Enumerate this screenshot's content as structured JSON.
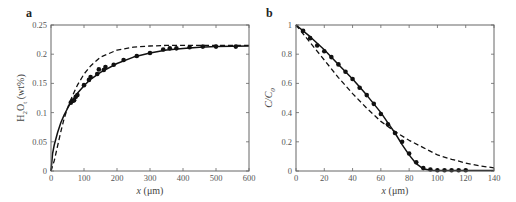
{
  "chart_data": [
    {
      "panel": "a",
      "type": "line",
      "title": "",
      "xlabel": "x (μm)",
      "ylabel": "H2Ot (wt%)",
      "xlim": [
        0,
        600
      ],
      "ylim": [
        0,
        0.25
      ],
      "xticks": [
        0,
        100,
        200,
        300,
        400,
        500,
        600
      ],
      "yticks": [
        0,
        0.05,
        0.1,
        0.15,
        0.2,
        0.25
      ],
      "xtick_labels": [
        "0",
        "100",
        "200",
        "300",
        "400",
        "500",
        "600"
      ],
      "ytick_labels": [
        "0",
        "0.05",
        "0.1",
        "0.15",
        "0.2",
        "0.25"
      ],
      "grid": false,
      "legend": null,
      "series": [
        {
          "name": "measured",
          "style": "points",
          "x": [
            60,
            65,
            70,
            75,
            80,
            100,
            115,
            120,
            140,
            145,
            160,
            165,
            190,
            220,
            260,
            300,
            340,
            360,
            380,
            420,
            460,
            500,
            560
          ],
          "y": [
            0.117,
            0.12,
            0.121,
            0.127,
            0.13,
            0.147,
            0.156,
            0.161,
            0.166,
            0.174,
            0.173,
            0.178,
            0.182,
            0.19,
            0.197,
            0.202,
            0.208,
            0.21,
            0.21,
            0.212,
            0.213,
            0.213,
            0.213
          ]
        },
        {
          "name": "fit (solid)",
          "style": "solid",
          "x": [
            0,
            5,
            10,
            20,
            30,
            40,
            50,
            60,
            80,
            100,
            120,
            150,
            200,
            250,
            300,
            350,
            400,
            450,
            500,
            600
          ],
          "y": [
            0,
            0.03,
            0.045,
            0.066,
            0.083,
            0.096,
            0.107,
            0.117,
            0.133,
            0.146,
            0.157,
            0.169,
            0.184,
            0.195,
            0.202,
            0.207,
            0.21,
            0.212,
            0.213,
            0.214
          ]
        },
        {
          "name": "model (dashed)",
          "style": "dashed",
          "x": [
            0,
            10,
            20,
            30,
            40,
            50,
            60,
            70,
            80,
            100,
            120,
            150,
            200,
            250,
            300,
            350,
            400,
            500,
            600
          ],
          "y": [
            0,
            0.018,
            0.043,
            0.068,
            0.09,
            0.108,
            0.122,
            0.135,
            0.147,
            0.166,
            0.18,
            0.195,
            0.207,
            0.212,
            0.214,
            0.215,
            0.215,
            0.215,
            0.215
          ]
        }
      ]
    },
    {
      "panel": "b",
      "type": "line",
      "title": "",
      "xlabel": "x (μm)",
      "ylabel": "C/C0",
      "xlim": [
        0,
        140
      ],
      "ylim": [
        0,
        1
      ],
      "xticks": [
        0,
        20,
        40,
        60,
        80,
        100,
        120,
        140
      ],
      "yticks": [
        0,
        0.2,
        0.4,
        0.6,
        0.8,
        1
      ],
      "xtick_labels": [
        "0",
        "20",
        "40",
        "60",
        "80",
        "100",
        "120",
        "140"
      ],
      "ytick_labels": [
        "0",
        "0.2",
        "0.4",
        "0.6",
        "0.8",
        "1"
      ],
      "grid": false,
      "legend": null,
      "series": [
        {
          "name": "measured",
          "style": "points",
          "x": [
            5,
            10,
            15,
            20,
            25,
            30,
            35,
            40,
            45,
            50,
            55,
            60,
            65,
            70,
            75,
            80,
            85,
            90,
            95,
            100,
            105,
            110,
            115,
            120
          ],
          "y": [
            0.96,
            0.91,
            0.86,
            0.82,
            0.78,
            0.73,
            0.68,
            0.63,
            0.57,
            0.52,
            0.46,
            0.39,
            0.32,
            0.26,
            0.2,
            0.12,
            0.06,
            0.02,
            0.01,
            0.005,
            0.005,
            0.005,
            0.005,
            0.005
          ]
        },
        {
          "name": "fit (solid)",
          "style": "solid",
          "x": [
            0,
            10,
            20,
            30,
            40,
            50,
            60,
            65,
            70,
            75,
            80,
            85,
            90,
            95,
            100,
            140
          ],
          "y": [
            1.0,
            0.92,
            0.83,
            0.73,
            0.63,
            0.52,
            0.4,
            0.33,
            0.26,
            0.18,
            0.11,
            0.05,
            0.015,
            0.005,
            0.003,
            0.003
          ]
        },
        {
          "name": "model (dashed)",
          "style": "dashed",
          "x": [
            0,
            10,
            20,
            30,
            40,
            50,
            60,
            70,
            80,
            90,
            100,
            110,
            120,
            130,
            140
          ],
          "y": [
            1.0,
            0.88,
            0.76,
            0.64,
            0.53,
            0.43,
            0.34,
            0.27,
            0.21,
            0.16,
            0.11,
            0.08,
            0.055,
            0.035,
            0.022
          ]
        }
      ]
    }
  ],
  "panels": {
    "a": {
      "letter": "a",
      "ylabel_main": "H",
      "ylabel_sub1": "2",
      "ylabel_mid": "O",
      "ylabel_sub2": "t",
      "ylabel_unit": " (wt%)",
      "xlabel_var": "x",
      "xlabel_unit": " (μm)"
    },
    "b": {
      "letter": "b",
      "ylabel_main": "C/C",
      "ylabel_sub": "0",
      "xlabel_var": "x",
      "xlabel_unit": " (μm)"
    }
  }
}
